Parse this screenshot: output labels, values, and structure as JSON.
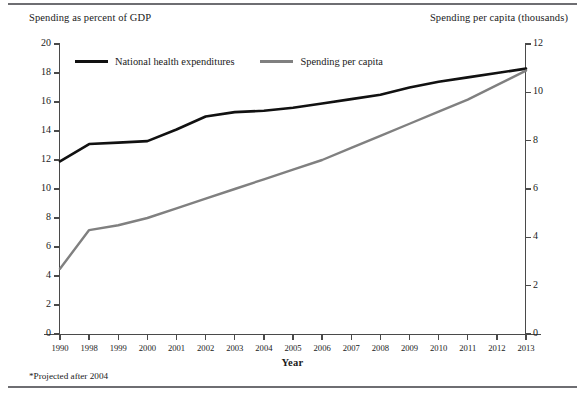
{
  "figure": {
    "left_axis_title": "Spending as percent of GDP",
    "right_axis_title": "Spending per capita (thousands)",
    "xaxis_label": "Year",
    "footnote": "*Projected after 2004"
  },
  "legend": {
    "items": [
      {
        "label": "National health expenditures",
        "color": "#111111"
      },
      {
        "label": "Spending per capita",
        "color": "#808080"
      }
    ]
  },
  "chart_data": {
    "type": "line",
    "title": "",
    "subtitle": "",
    "xlabel": "Year",
    "ylabel": "Spending as percent of GDP",
    "y2label": "Spending per capita (thousands)",
    "grid": false,
    "legend_position": "top-left-inside",
    "categories": [
      "1990",
      "1998",
      "1999",
      "2000",
      "2001",
      "2002",
      "2003",
      "2004",
      "2005",
      "2006",
      "2007",
      "2008",
      "2009",
      "2010",
      "2011",
      "2012",
      "2013"
    ],
    "x_tick_labels": [
      "1990",
      "1998",
      "1999",
      "2000",
      "2001",
      "2002",
      "2003",
      "2004",
      "2005",
      "2006",
      "2007",
      "2008",
      "2009",
      "2010",
      "2011",
      "2012",
      "2013"
    ],
    "ylim": [
      0,
      20
    ],
    "y_ticks": [
      0,
      2,
      4,
      6,
      8,
      10,
      12,
      14,
      16,
      18,
      20
    ],
    "y_tick_labels": [
      "0",
      "2",
      "4",
      "6",
      "8",
      "10",
      "12",
      "14",
      "16",
      "18",
      "20"
    ],
    "y2lim": [
      0,
      12
    ],
    "y2_ticks": [
      0,
      2,
      4,
      6,
      8,
      10,
      12
    ],
    "y2_tick_labels": [
      "0",
      "2",
      "4",
      "6",
      "8",
      "10",
      "12"
    ],
    "series": [
      {
        "name": "National health expenditures",
        "axis": "left",
        "color": "#111111",
        "width": 2.6,
        "values": [
          11.9,
          13.1,
          13.2,
          13.3,
          14.1,
          15.0,
          15.3,
          15.4,
          15.6,
          15.9,
          16.2,
          16.5,
          17.0,
          17.4,
          17.7,
          18.0,
          18.3
        ]
      },
      {
        "name": "Spending per capita",
        "axis": "right",
        "color": "#808080",
        "width": 2.4,
        "values": [
          2.7,
          4.3,
          4.5,
          4.8,
          5.2,
          5.6,
          6.0,
          6.4,
          6.8,
          7.2,
          7.7,
          8.2,
          8.7,
          9.2,
          9.7,
          10.3,
          10.9
        ]
      }
    ]
  }
}
